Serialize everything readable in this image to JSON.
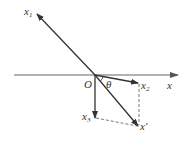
{
  "labels": {
    "x1": "x",
    "x1_sub": "1",
    "x2": "x",
    "x2_sub": "2",
    "x3": "x",
    "x3_sub": "3",
    "x_axis": "x",
    "x_prime": "x'",
    "origin": "O",
    "angle": "θ"
  },
  "colors": {
    "axis": "#888888",
    "vector": "#333333",
    "dashed": "#555555"
  }
}
